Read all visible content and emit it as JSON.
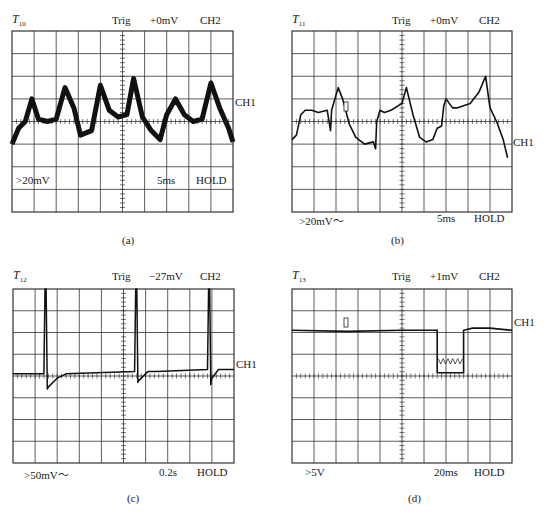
{
  "panels": [
    {
      "id": "a",
      "title": "T",
      "title_sub": "10",
      "trig_label": "Trig",
      "trig_level": "+0mV",
      "trig_channel": "CH2",
      "channel_marker": "CH1",
      "volts_div": ">20mV",
      "time_div": "5ms",
      "mode": "HOLD",
      "caption": "(a)"
    },
    {
      "id": "b",
      "title": "T",
      "title_sub": "11",
      "trig_label": "Trig",
      "trig_level": "+0mV",
      "trig_channel": "CH2",
      "channel_marker": "CH1",
      "volts_div": ">20mV～",
      "time_div": "5ms",
      "mode": "HOLD",
      "caption": "(b)"
    },
    {
      "id": "c",
      "title": "T",
      "title_sub": "12",
      "trig_label": "Trig",
      "trig_level": "−27mV",
      "trig_channel": "CH2",
      "channel_marker": "CH1",
      "volts_div": ">50mV～",
      "time_div": "0.2s",
      "mode": "HOLD",
      "caption": "(c)"
    },
    {
      "id": "d",
      "title": "T",
      "title_sub": "13",
      "trig_label": "Trig",
      "trig_level": "+1mV",
      "trig_channel": "CH2",
      "channel_marker": "CH1",
      "volts_div": ">5V",
      "time_div": "20ms",
      "mode": "HOLD",
      "caption": "(d)"
    }
  ],
  "chart_data": [
    {
      "type": "line",
      "title": "T10",
      "grid": {
        "cols": 10,
        "rows": 8,
        "on": true
      },
      "xlabel": "5ms/div",
      "ylabel": ">20mV/div",
      "xlim": [
        0,
        10
      ],
      "ylim": [
        -4,
        4
      ],
      "x": [
        0,
        0.3,
        0.6,
        0.9,
        1.2,
        1.6,
        2.0,
        2.4,
        2.8,
        3.1,
        3.6,
        4.0,
        4.4,
        4.8,
        5.2,
        5.5,
        5.9,
        6.3,
        6.7,
        7.0,
        7.4,
        7.8,
        8.2,
        8.6,
        9.0,
        9.4,
        9.8,
        10.0
      ],
      "y": [
        -1.0,
        -0.3,
        0.0,
        1.0,
        0.1,
        0.0,
        0.1,
        1.5,
        0.6,
        -0.6,
        -0.4,
        1.6,
        0.5,
        0.2,
        0.3,
        1.9,
        0.2,
        -0.4,
        -0.8,
        0.3,
        1.0,
        0.3,
        0.0,
        0.1,
        1.7,
        0.6,
        -0.3,
        -0.9
      ],
      "annotations": [
        "CH1 marker at -1 div"
      ]
    },
    {
      "type": "line",
      "title": "T11",
      "grid": {
        "cols": 10,
        "rows": 8,
        "on": true
      },
      "xlabel": "5ms/div",
      "ylabel": ">20mV～/div",
      "xlim": [
        0,
        10
      ],
      "ylim": [
        -4,
        4
      ],
      "x": [
        0,
        0.2,
        0.4,
        0.6,
        0.9,
        1.2,
        1.6,
        1.75,
        1.8,
        2.1,
        2.3,
        2.6,
        2.9,
        3.3,
        3.7,
        3.8,
        3.85,
        4.0,
        4.2,
        4.5,
        5.0,
        5.2,
        5.5,
        5.8,
        6.1,
        6.4,
        6.6,
        6.8,
        6.9,
        7.0,
        7.3,
        7.5,
        7.8,
        8.1,
        8.5,
        8.8,
        9.0,
        9.3,
        9.6,
        9.8
      ],
      "y": [
        -0.8,
        -0.6,
        0.3,
        0.5,
        0.5,
        0.4,
        0.5,
        -0.4,
        0.5,
        1.5,
        1.0,
        -0.1,
        -0.7,
        -1.0,
        -0.9,
        -1.2,
        0.0,
        0.5,
        0.4,
        0.5,
        0.8,
        1.5,
        0.3,
        -0.7,
        -0.9,
        -0.8,
        -0.3,
        -0.2,
        0.7,
        1.0,
        0.6,
        0.6,
        0.7,
        0.8,
        1.3,
        2.0,
        0.6,
        0.0,
        -0.8,
        -1.6
      ],
      "annotations": [
        "CH1 marker at -1 div",
        "cursor box near x=2.5, y=0.6"
      ]
    },
    {
      "type": "line",
      "title": "T12",
      "grid": {
        "cols": 10,
        "rows": 8,
        "on": true
      },
      "xlabel": "0.2s/div",
      "ylabel": ">50mV～/div",
      "xlim": [
        0,
        10
      ],
      "ylim": [
        -4,
        4
      ],
      "x": [
        0,
        1.4,
        1.45,
        1.5,
        1.55,
        1.6,
        2.0,
        2.4,
        5.5,
        5.55,
        5.6,
        5.65,
        5.7,
        6.1,
        6.5,
        8.8,
        8.85,
        8.9,
        8.95,
        9.0,
        9.3,
        10.0
      ],
      "y": [
        0.1,
        0.1,
        4.0,
        4.0,
        -0.6,
        -0.5,
        -0.1,
        0.1,
        0.2,
        4.0,
        4.0,
        -0.3,
        -0.2,
        0.2,
        0.2,
        0.3,
        4.0,
        4.0,
        -0.4,
        -0.1,
        0.3,
        0.3
      ],
      "annotations": [
        "periodic spikes exceed screen top",
        "CH1 marker at +0.3 div"
      ]
    },
    {
      "type": "line",
      "title": "T13",
      "grid": {
        "cols": 10,
        "rows": 8,
        "on": true
      },
      "xlabel": "20ms/div",
      "ylabel": ">5V/div",
      "xlim": [
        0,
        10
      ],
      "ylim": [
        -4,
        4
      ],
      "x": [
        0,
        2.5,
        5.0,
        6.6,
        6.6,
        7.8,
        7.8,
        8.2,
        9.0,
        10.0
      ],
      "y": [
        2.1,
        2.05,
        2.1,
        2.1,
        0.15,
        0.15,
        2.1,
        2.2,
        2.2,
        2.1
      ],
      "annotations": [
        "rectangular dropout with small ripple near 0.6 div",
        "cursor box near x=2.5",
        "CH1 marker at +2 div"
      ]
    }
  ]
}
